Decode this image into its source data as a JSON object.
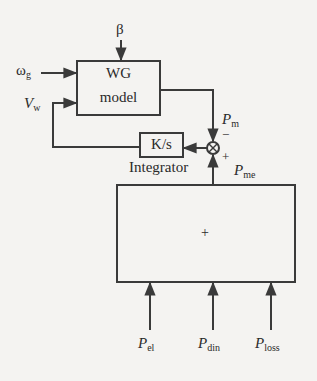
{
  "diagram": {
    "blocks": {
      "wg_model": {
        "line1": "WG",
        "line2": "model"
      },
      "integrator": {
        "label": "K/s",
        "caption": "Integrator"
      },
      "sum_box": {
        "label": "+"
      }
    },
    "signals": {
      "beta": "β",
      "omega_g": {
        "base": "ω",
        "sub": "g"
      },
      "v_w": {
        "base": "V",
        "sub": "w"
      },
      "p_m": {
        "base": "P",
        "sub": "m"
      },
      "p_me": {
        "base": "P",
        "sub": "me"
      },
      "p_el": {
        "base": "P",
        "sub": "el"
      },
      "p_din": {
        "base": "P",
        "sub": "din"
      },
      "p_loss": {
        "base": "P",
        "sub": "loss"
      }
    },
    "junction": {
      "minus_sign": "−",
      "plus_sign": "+"
    },
    "colors": {
      "line": "#3a3a3a",
      "background": "#f4f3f1"
    }
  }
}
